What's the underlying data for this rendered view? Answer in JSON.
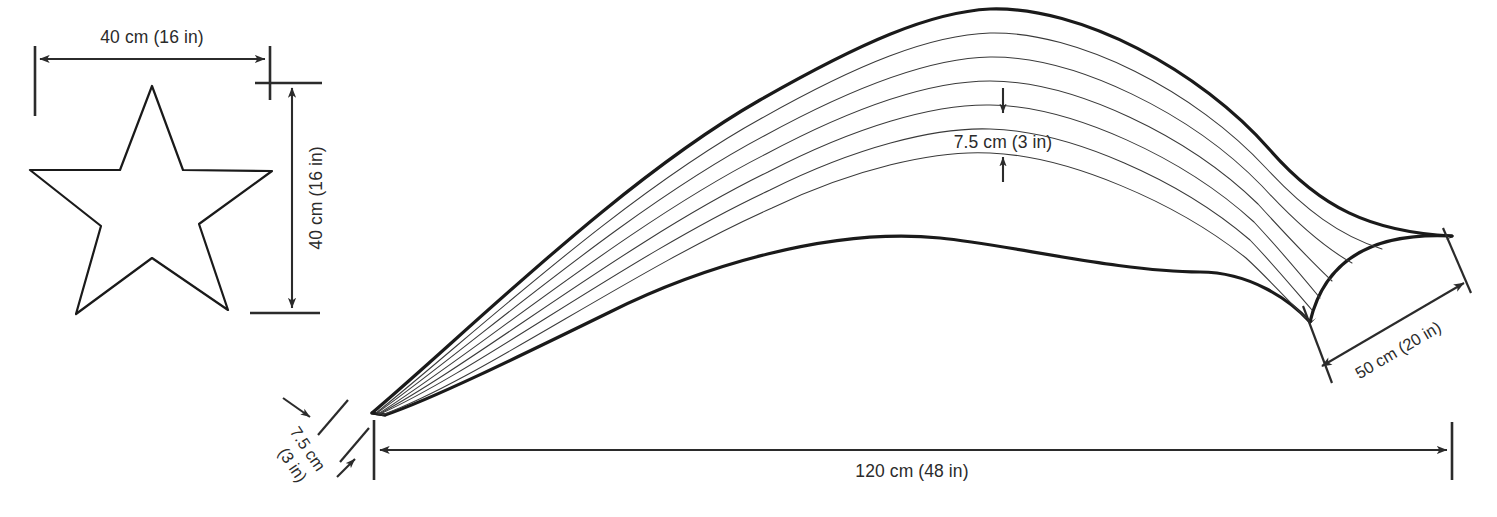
{
  "figure": {
    "background_color": "#ffffff",
    "line_color": "#1a1a1a",
    "text_color": "#2b2b2b"
  },
  "star": {
    "name": "five-point-star",
    "width_label": "40 cm (16 in)",
    "height_label": "40 cm (16 in)"
  },
  "arch": {
    "name": "curved-arch-with-strips",
    "strip_count": 7,
    "interior_line_count": 6,
    "thickness_label": "7.5 cm (3 in)",
    "tip_thickness_label_line1": "7.5 cm",
    "tip_thickness_label_line2": "(3 in)",
    "span_label": "120 cm (48 in)",
    "end_width_label": "50 cm (20 in)"
  },
  "dimensions": [
    {
      "id": "star-width",
      "label": "40 cm (16 in)",
      "orientation": "horizontal"
    },
    {
      "id": "star-height",
      "label": "40 cm (16 in)",
      "orientation": "vertical"
    },
    {
      "id": "arch-thickness",
      "label": "7.5 cm (3 in)",
      "orientation": "vertical"
    },
    {
      "id": "arch-tip-thickness",
      "label": "7.5 cm (3 in)",
      "orientation": "diagonal"
    },
    {
      "id": "arch-span",
      "label": "120 cm (48 in)",
      "orientation": "horizontal"
    },
    {
      "id": "arch-end-width",
      "label": "50 cm (20 in)",
      "orientation": "diagonal"
    }
  ]
}
